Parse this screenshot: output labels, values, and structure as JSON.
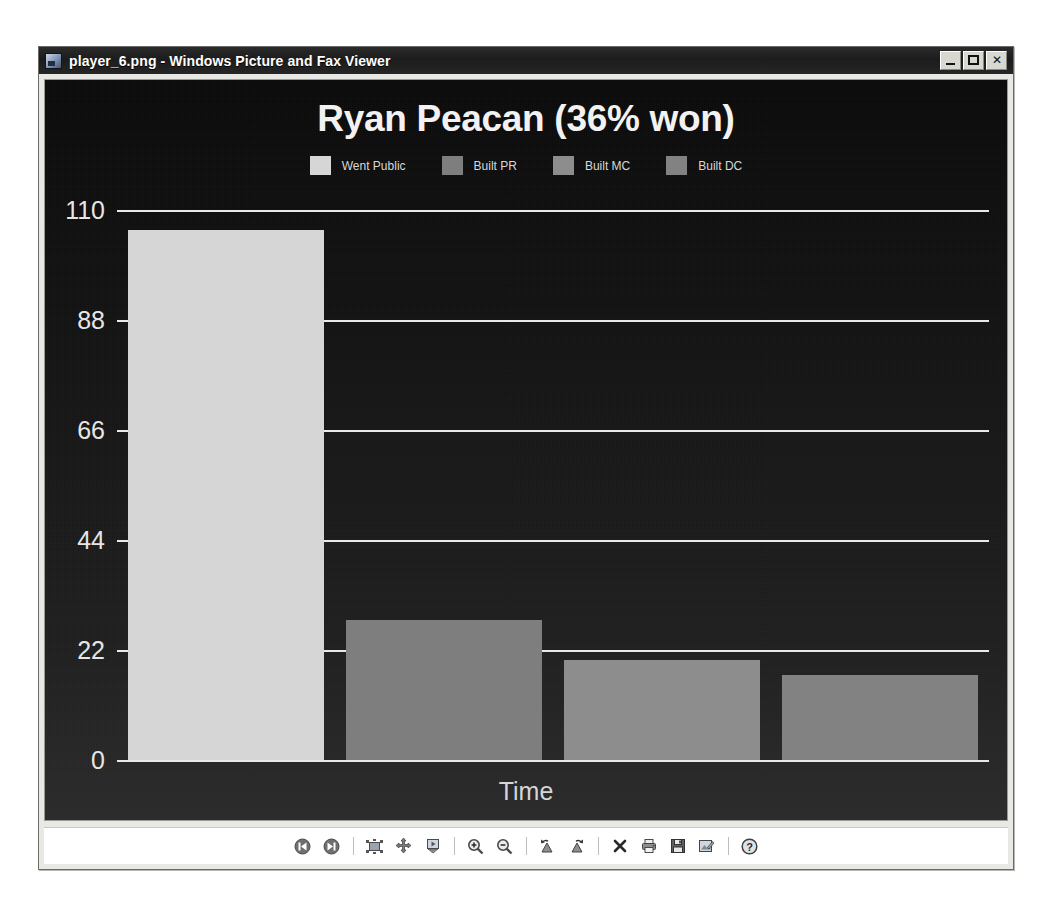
{
  "window": {
    "title": "player_6.png - Windows Picture and Fax Viewer",
    "app_icon": "picture-viewer-icon",
    "controls": {
      "minimize": "minimize-button",
      "maximize": "maximize-button",
      "close_label": "✕"
    }
  },
  "toolbar": {
    "buttons": [
      {
        "name": "previous-image-button",
        "label": "Previous Image",
        "icon": "skip-back-icon"
      },
      {
        "name": "next-image-button",
        "label": "Next Image",
        "icon": "skip-forward-icon"
      },
      {
        "name": "best-fit-button",
        "label": "Best Fit",
        "icon": "best-fit-icon"
      },
      {
        "name": "actual-size-button",
        "label": "Actual Size",
        "icon": "actual-size-icon"
      },
      {
        "name": "start-slideshow-button",
        "label": "Start Slide Show",
        "icon": "slideshow-icon"
      },
      {
        "name": "zoom-in-button",
        "label": "Zoom In",
        "icon": "magnifier-plus-icon"
      },
      {
        "name": "zoom-out-button",
        "label": "Zoom Out",
        "icon": "magnifier-minus-icon"
      },
      {
        "name": "rotate-counterclockwise-button",
        "label": "Rotate Counterclockwise",
        "icon": "rotate-left-icon"
      },
      {
        "name": "rotate-clockwise-button",
        "label": "Rotate Clockwise",
        "icon": "rotate-right-icon"
      },
      {
        "name": "delete-button",
        "label": "Delete",
        "icon": "x-icon"
      },
      {
        "name": "print-button",
        "label": "Print",
        "icon": "printer-icon"
      },
      {
        "name": "copy-to-button",
        "label": "Copy To",
        "icon": "floppy-save-icon"
      },
      {
        "name": "edit-button",
        "label": "Edit",
        "icon": "edit-image-icon"
      },
      {
        "name": "help-button",
        "label": "Help",
        "icon": "question-circle-icon"
      }
    ]
  },
  "chart_data": {
    "type": "bar",
    "title": "Ryan Peacan (36% won)",
    "xlabel": "Time",
    "ylabel": "",
    "categories": [
      "Went Public",
      "Built PR",
      "Built MC",
      "Built DC"
    ],
    "values": [
      106,
      28,
      20,
      17
    ],
    "ylim": [
      0,
      110
    ],
    "yticks": [
      0,
      22,
      44,
      66,
      88,
      110
    ],
    "grid": true,
    "legend_position": "top",
    "legend": [
      {
        "label": "Went Public",
        "color": "#d6d6d6"
      },
      {
        "label": "Built PR",
        "color": "#7e7e7e"
      },
      {
        "label": "Built MC",
        "color": "#8d8d8d"
      },
      {
        "label": "Built DC",
        "color": "#828282"
      }
    ],
    "background_color": "#141414",
    "gridline_color": "#e9e9e9",
    "text_color": "#e6e6e6"
  }
}
